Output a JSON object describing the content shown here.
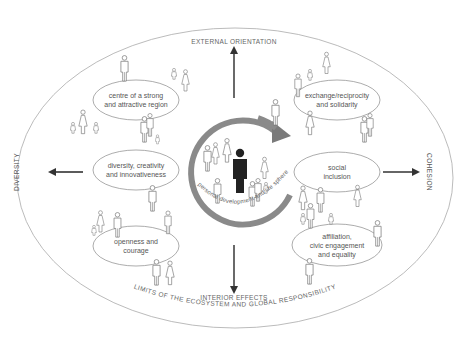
{
  "diagram": {
    "axes": {
      "top": "EXTERNAL ORIENTATION",
      "bottom": "INTERIOR EFFECTS",
      "left": "DIVERSITY",
      "right": "COHESION"
    },
    "boundary_label": "LIMITS OF THE ECOSYSTEM AND GLOBAL RESPONSIBILITY",
    "center_label": "personal development and life sphere",
    "left_ovals": [
      {
        "line1": "centre of a strong",
        "line2": "and attractive region"
      },
      {
        "line1": "diversity, creativity",
        "line2": "and innovativeness"
      },
      {
        "line1": "openness and",
        "line2": "courage"
      }
    ],
    "right_ovals": [
      {
        "line1": "exchange/reciprocity",
        "line2": "and solidarity"
      },
      {
        "line1": "social",
        "line2": "inclusion"
      },
      {
        "line1": "affiliation,",
        "line2": "civic engagement",
        "line3": "and equality"
      }
    ],
    "colors": {
      "outline": "#999999",
      "text": "#555555",
      "arrow": "#333333",
      "ring": "#8a8a8a",
      "center_figure": "#222222"
    }
  }
}
